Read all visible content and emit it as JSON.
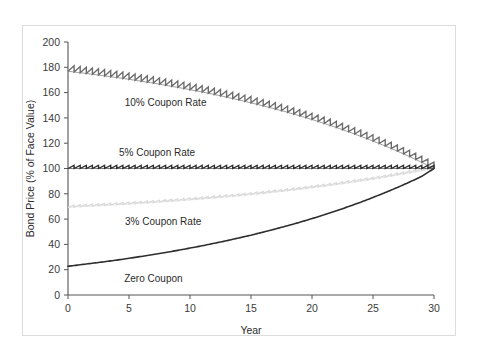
{
  "figure": {
    "background": "#ffffff",
    "frame_color": "#dcdcdc"
  },
  "chart_data": {
    "type": "line",
    "title": "",
    "subtitle": "",
    "xlabel": "Year",
    "ylabel": "Bond Price (% of Face Value)",
    "xlim": [
      0,
      30
    ],
    "ylim": [
      0,
      200
    ],
    "xticks": [
      0,
      5,
      10,
      15,
      20,
      25,
      30
    ],
    "xtick_labels": [
      "0",
      "5",
      "10",
      "15",
      "20",
      "25",
      "30"
    ],
    "yticks": [
      0,
      20,
      40,
      60,
      80,
      100,
      120,
      140,
      160,
      180,
      200
    ],
    "ytick_labels": [
      "0",
      "20",
      "40",
      "60",
      "80",
      "100",
      "120",
      "140",
      "160",
      "180",
      "200"
    ],
    "grid": false,
    "legend": "inline-annotations",
    "note": "Bond price paths to maturity at a constant 5% market yield; all bonds converge to 100 (par) at year 30. Coupon-bearing series show sawtooth accrued-interest jumps each coupon period.",
    "series": [
      {
        "name": "10% Coupon Rate",
        "color": "#6b6b6b",
        "coupon_rate": 10,
        "style": "sawtooth",
        "start_value": 177,
        "end_value": 100,
        "label_x": 8.0,
        "label_y": 152,
        "x": [
          0,
          1,
          2,
          3,
          4,
          5,
          6,
          7,
          8,
          9,
          10,
          11,
          12,
          13,
          14,
          15,
          16,
          17,
          18,
          19,
          20,
          21,
          22,
          23,
          24,
          25,
          26,
          27,
          28,
          29,
          30
        ],
        "values": [
          176.9,
          175.7,
          174.5,
          173.2,
          171.9,
          170.5,
          169.0,
          167.5,
          165.8,
          164.1,
          162.3,
          160.5,
          158.5,
          156.4,
          154.2,
          151.9,
          149.5,
          147.0,
          144.4,
          141.6,
          138.7,
          135.6,
          132.4,
          129.0,
          125.4,
          121.7,
          117.8,
          113.7,
          109.4,
          104.8,
          100.0
        ]
      },
      {
        "name": "5% Coupon Rate",
        "color": "#2e2e2e",
        "coupon_rate": 5,
        "style": "sawtooth",
        "start_value": 100,
        "end_value": 100,
        "label_x": 7.3,
        "label_y": 113,
        "x": [
          0,
          1,
          2,
          3,
          4,
          5,
          6,
          7,
          8,
          9,
          10,
          11,
          12,
          13,
          14,
          15,
          16,
          17,
          18,
          19,
          20,
          21,
          22,
          23,
          24,
          25,
          26,
          27,
          28,
          29,
          30
        ],
        "values": [
          100,
          100,
          100,
          100,
          100,
          100,
          100,
          100,
          100,
          100,
          100,
          100,
          100,
          100,
          100,
          100,
          100,
          100,
          100,
          100,
          100,
          100,
          100,
          100,
          100,
          100,
          100,
          100,
          100,
          100,
          100
        ]
      },
      {
        "name": "3% Coupon Rate",
        "color": "#dadada",
        "coupon_rate": 3,
        "style": "sawtooth",
        "start_value": 69.3,
        "end_value": 100,
        "label_x": 7.8,
        "label_y": 58,
        "x": [
          0,
          1,
          2,
          3,
          4,
          5,
          6,
          7,
          8,
          9,
          10,
          11,
          12,
          13,
          14,
          15,
          16,
          17,
          18,
          19,
          20,
          21,
          22,
          23,
          24,
          25,
          26,
          27,
          28,
          29,
          30
        ],
        "values": [
          69.3,
          69.8,
          70.3,
          70.8,
          71.3,
          71.9,
          72.5,
          73.1,
          73.8,
          74.5,
          75.2,
          75.9,
          76.7,
          77.6,
          78.4,
          79.4,
          80.3,
          81.4,
          82.4,
          83.6,
          84.8,
          86.0,
          87.3,
          88.7,
          90.1,
          91.6,
          93.2,
          94.9,
          96.6,
          98.3,
          100.0
        ]
      },
      {
        "name": "Zero Coupon",
        "color": "#2e2e2e",
        "coupon_rate": 0,
        "style": "smooth",
        "start_value": 22.7,
        "end_value": 100,
        "label_x": 7.0,
        "label_y": 13,
        "x": [
          0,
          1,
          2,
          3,
          4,
          5,
          6,
          7,
          8,
          9,
          10,
          11,
          12,
          13,
          14,
          15,
          16,
          17,
          18,
          19,
          20,
          21,
          22,
          23,
          24,
          25,
          26,
          27,
          28,
          29,
          30
        ],
        "values": [
          22.7,
          23.9,
          25.1,
          26.3,
          27.6,
          29.0,
          30.5,
          32.0,
          33.6,
          35.3,
          37.1,
          38.9,
          40.9,
          42.9,
          45.1,
          47.3,
          49.7,
          52.2,
          54.8,
          57.5,
          60.4,
          63.4,
          66.6,
          69.9,
          73.4,
          77.1,
          81.0,
          85.0,
          89.3,
          93.8,
          100.0
        ]
      }
    ]
  }
}
